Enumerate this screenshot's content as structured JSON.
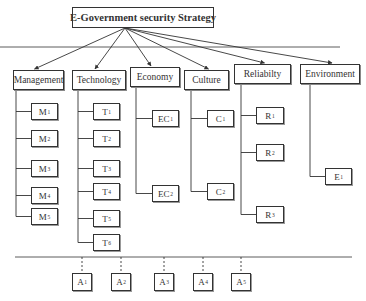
{
  "root": {
    "label": "E-Government security Strategy",
    "x": 72,
    "y": 7,
    "w": 142,
    "h": 21
  },
  "categories": [
    {
      "id": "management",
      "label": "Management",
      "x": 13,
      "y": 70,
      "w": 51,
      "h": 20,
      "trunk": 16,
      "children": [
        {
          "base": "M",
          "sub": "1",
          "y": 103
        },
        {
          "base": "M",
          "sub": "2",
          "y": 130
        },
        {
          "base": "M",
          "sub": "3",
          "y": 160
        },
        {
          "base": "M",
          "sub": "4",
          "y": 187
        },
        {
          "base": "M",
          "sub": "5",
          "y": 208
        }
      ],
      "childX": 31,
      "childW": 27
    },
    {
      "id": "technology",
      "label": "Technology",
      "x": 72,
      "y": 70,
      "w": 54,
      "h": 20,
      "trunk": 78,
      "children": [
        {
          "base": "T",
          "sub": "1",
          "y": 103
        },
        {
          "base": "T",
          "sub": "2",
          "y": 130
        },
        {
          "base": "T",
          "sub": "3",
          "y": 160
        },
        {
          "base": "T",
          "sub": "4",
          "y": 183
        },
        {
          "base": "T",
          "sub": "5",
          "y": 210
        },
        {
          "base": "T",
          "sub": "6",
          "y": 234
        }
      ],
      "childX": 93,
      "childW": 27
    },
    {
      "id": "economy",
      "label": "Economy",
      "x": 130,
      "y": 67,
      "w": 50,
      "h": 20,
      "trunk": 136,
      "children": [
        {
          "base": "EC",
          "sub": "1",
          "y": 110
        },
        {
          "base": "EC",
          "sub": "2",
          "y": 185
        }
      ],
      "childX": 152,
      "childW": 27
    },
    {
      "id": "culture",
      "label": "Culture",
      "x": 184,
      "y": 70,
      "w": 45,
      "h": 20,
      "trunk": 191,
      "children": [
        {
          "base": "C",
          "sub": "1",
          "y": 110
        },
        {
          "base": "C",
          "sub": "2",
          "y": 183
        }
      ],
      "childX": 207,
      "childW": 27
    },
    {
      "id": "reliability",
      "label": "Reliabilty",
      "x": 234,
      "y": 64,
      "w": 57,
      "h": 20,
      "trunk": 241,
      "children": [
        {
          "base": "R",
          "sub": "1",
          "y": 107
        },
        {
          "base": "R",
          "sub": "2",
          "y": 144
        },
        {
          "base": "R",
          "sub": "3",
          "y": 206
        }
      ],
      "childX": 256,
      "childW": 28
    },
    {
      "id": "environment",
      "label": "Environment",
      "x": 300,
      "y": 64,
      "w": 60,
      "h": 20,
      "trunk": 310,
      "children": [
        {
          "base": "E",
          "sub": "1",
          "y": 168
        }
      ],
      "childX": 325,
      "childW": 27
    }
  ],
  "lines": {
    "top_separator": {
      "x1": 0,
      "x2": 340,
      "y": 47
    },
    "bottom_separator": {
      "x1": 15,
      "x2": 352,
      "y": 257
    }
  },
  "actors": [
    {
      "base": "A",
      "sub": "1",
      "x": 73,
      "cx": 82
    },
    {
      "base": "A",
      "sub": "2",
      "x": 110,
      "cx": 121
    },
    {
      "base": "A",
      "sub": "3",
      "x": 152,
      "cx": 164
    },
    {
      "base": "A",
      "sub": "4",
      "x": 191,
      "cx": 203
    },
    {
      "base": "A",
      "sub": "5",
      "x": 234,
      "cx": 241
    }
  ],
  "actor_box": {
    "y": 273,
    "w": 20,
    "h": 18
  },
  "leaf_h": 17,
  "colors": {
    "line": "#333333",
    "box_border": "#333333",
    "background": "#ffffff"
  }
}
